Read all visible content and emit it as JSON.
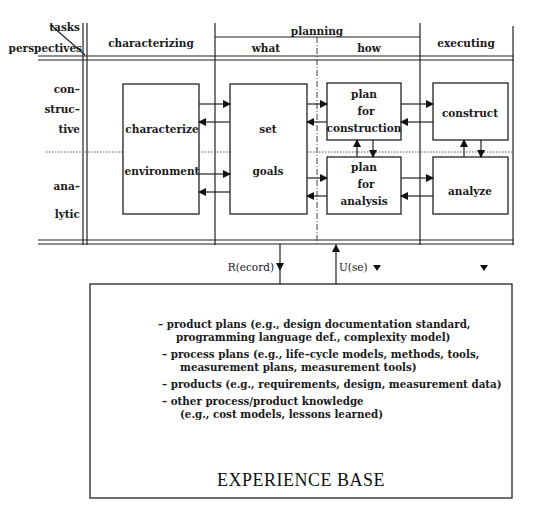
{
  "header": {
    "tasks": "tasks",
    "perspectives": "perspectives",
    "characterizing": "characterizing",
    "planning": "planning",
    "what": "what",
    "how": "how",
    "executing": "executing"
  },
  "rows": {
    "constructive": [
      "con–",
      "struc–",
      "tive"
    ],
    "analytic": [
      "ana–",
      "lytic"
    ]
  },
  "boxes": {
    "characterize_environment": [
      "characterize",
      "environment"
    ],
    "set_goals": [
      "set",
      "goals"
    ],
    "plan_for_construction": [
      "plan",
      "for",
      "construction"
    ],
    "plan_for_analysis": [
      "plan",
      "for",
      "analysis"
    ],
    "construct": "construct",
    "analyze": "analyze"
  },
  "links": {
    "record": "R(ecord)",
    "use": "U(se)"
  },
  "experience_base": {
    "title": "EXPERIENCE BASE",
    "items": [
      {
        "line1": "– product plans (e.g., design documentation standard,",
        "line2": "programming language def., complexity model)"
      },
      {
        "line1": "– process plans (e.g., life–cycle models, methods, tools,",
        "line2": "measurement plans, measurement tools)"
      },
      {
        "line1": "– products (e.g., requirements, design, measurement data)",
        "line2": ""
      },
      {
        "line1": "– other process/product knowledge",
        "line2": "(e.g., cost models, lessons learned)"
      }
    ]
  }
}
